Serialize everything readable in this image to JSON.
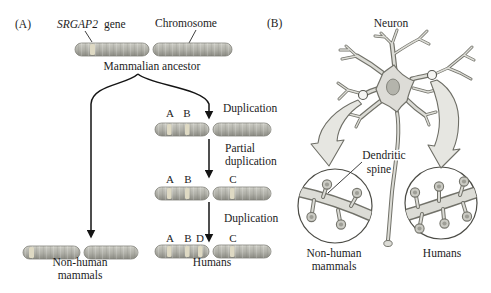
{
  "figure": {
    "panel_a": {
      "label": "(A)",
      "gene_label_italic": "SRGAP2",
      "gene_label_rest": "gene",
      "chromosome_label": "Chromosome",
      "ancestor_label": "Mammalian ancestor",
      "step1_label": "Duplication",
      "step2_label_line1": "Partial",
      "step2_label_line2": "duplication",
      "step3_label": "Duplication",
      "letters": {
        "a": "A",
        "b": "B",
        "c": "C",
        "d": "D"
      },
      "nonhuman_label_line1": "Non-human",
      "nonhuman_label_line2": "mammals",
      "humans_label": "Humans"
    },
    "panel_b": {
      "label": "(B)",
      "neuron_label": "Neuron",
      "spine_label_line1": "Dendritic",
      "spine_label_line2": "spine",
      "nonhuman_label_line1": "Non-human",
      "nonhuman_label_line2": "mammals",
      "humans_label": "Humans"
    },
    "colors": {
      "chromosome_body": "#aeaea6",
      "chromosome_band": "#ded9c3",
      "neuron_fill": "#dddcd7",
      "neuron_outline": "#72726a",
      "arrow_black": "#141414",
      "zoom_arrow_fill": "#e6e6e1",
      "text": "#1c1c1c",
      "background": "#ffffff"
    }
  }
}
